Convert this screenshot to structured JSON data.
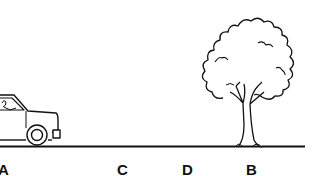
{
  "diagram": {
    "labels": [
      {
        "id": "A",
        "text": "A",
        "x": -2,
        "y": 162
      },
      {
        "id": "C",
        "text": "C",
        "x": 117,
        "y": 162
      },
      {
        "id": "D",
        "text": "D",
        "x": 182,
        "y": 162
      },
      {
        "id": "B",
        "text": "B",
        "x": 246,
        "y": 162
      }
    ],
    "objects": [
      "car",
      "tree",
      "ground-line"
    ],
    "colors": {
      "ink": "#111111",
      "background": "#ffffff"
    }
  }
}
